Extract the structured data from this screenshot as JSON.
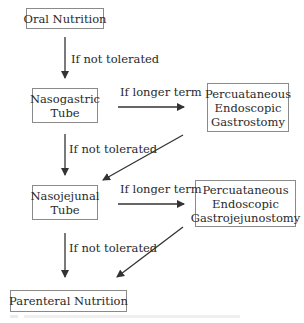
{
  "diagram": {
    "type": "flowchart",
    "nodes": {
      "oral": {
        "lines": [
          "Oral Nutrition"
        ]
      },
      "ng": {
        "lines": [
          "Nasogastric",
          "Tube"
        ]
      },
      "peg": {
        "lines": [
          "Percuataneous",
          "Endoscopic",
          "Gastrostomy"
        ]
      },
      "nj": {
        "lines": [
          "Nasojejunal",
          "Tube"
        ]
      },
      "pegj": {
        "lines": [
          "Percuataneous",
          "Endoscopic",
          "Gastrojejunostomy"
        ]
      },
      "pn": {
        "lines": [
          "Parenteral Nutrition"
        ]
      }
    },
    "edges": [
      {
        "from": "oral",
        "to": "ng",
        "label": "If not tolerated"
      },
      {
        "from": "ng",
        "to": "peg",
        "label": "If longer term"
      },
      {
        "from": "ng",
        "to": "nj",
        "label": "If not tolerated"
      },
      {
        "from": "peg",
        "to": "nj",
        "label": ""
      },
      {
        "from": "nj",
        "to": "pegj",
        "label": "If longer term"
      },
      {
        "from": "nj",
        "to": "pn",
        "label": "If not tolerated"
      },
      {
        "from": "pegj",
        "to": "pn",
        "label": ""
      }
    ],
    "colors": {
      "text": "#2a2a2a",
      "border": "#8a8a8a",
      "arrow": "#333333"
    }
  }
}
